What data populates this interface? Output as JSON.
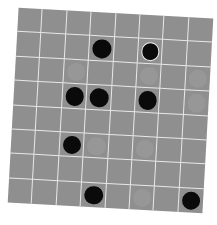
{
  "game": {
    "type": "board-grid",
    "rows": 8,
    "cols": 8,
    "rotation_deg": 3.2,
    "colors": {
      "board": "#8f8f8f",
      "grid_line": "#e8e8e8",
      "black_piece": "#0a0a0a",
      "ghost_piece": "#979797",
      "highlight_ring": "#f2f2f2"
    },
    "pieces": [
      {
        "row": 1,
        "col": 3,
        "kind": "black",
        "selected": false
      },
      {
        "row": 1,
        "col": 5,
        "kind": "black",
        "selected": true
      },
      {
        "row": 3,
        "col": 2,
        "kind": "black",
        "selected": false
      },
      {
        "row": 3,
        "col": 3,
        "kind": "black",
        "selected": false
      },
      {
        "row": 3,
        "col": 5,
        "kind": "black",
        "selected": false
      },
      {
        "row": 5,
        "col": 2,
        "kind": "black",
        "selected": false
      },
      {
        "row": 7,
        "col": 3,
        "kind": "black",
        "selected": false
      },
      {
        "row": 7,
        "col": 7,
        "kind": "black",
        "selected": false
      },
      {
        "row": 2,
        "col": 2,
        "kind": "ghost",
        "selected": false
      },
      {
        "row": 2,
        "col": 5,
        "kind": "ghost",
        "selected": false
      },
      {
        "row": 2,
        "col": 7,
        "kind": "ghost",
        "selected": false
      },
      {
        "row": 3,
        "col": 7,
        "kind": "ghost",
        "selected": false
      },
      {
        "row": 5,
        "col": 3,
        "kind": "ghost",
        "selected": false
      },
      {
        "row": 5,
        "col": 5,
        "kind": "ghost",
        "selected": false
      },
      {
        "row": 7,
        "col": 5,
        "kind": "ghost",
        "selected": false
      }
    ]
  }
}
